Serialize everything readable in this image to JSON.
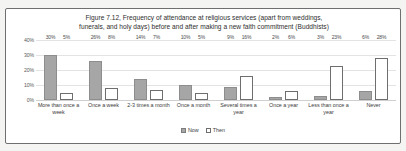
{
  "chart_data": {
    "type": "bar",
    "title": "Figure 7.12, Frequency of attendance at religious services (apart from weddings, funerals, and holy days) before and after making a new faith commitment (Buddhists)",
    "title_line1": "Figure 7.12, Frequency of attendance at religious services (apart from weddings,",
    "title_line2": "funerals, and holy days) before and after making a new faith commitment (Buddhists)",
    "xlabel": "",
    "ylabel": "",
    "ylim": [
      0,
      40
    ],
    "ytick_labels": [
      "40%",
      "30%",
      "20%",
      "10%",
      "0%"
    ],
    "ytick_values": [
      40,
      30,
      20,
      10,
      0
    ],
    "grid": true,
    "legend_position": "bottom",
    "categories": [
      "More than once a week",
      "Once a week",
      "2-3 times a month",
      "Once a month",
      "Several times a year",
      "Once a year",
      "Less than once a year",
      "Never"
    ],
    "series": [
      {
        "name": "Now",
        "color": "#a6a6a6",
        "values": [
          30,
          26,
          14,
          10,
          9,
          2,
          3,
          6
        ],
        "labels": [
          "30%",
          "26%",
          "14%",
          "10%",
          "9%",
          "2%",
          "3%",
          "6%"
        ]
      },
      {
        "name": "Then",
        "color": "#ffffff",
        "values": [
          5,
          8,
          7,
          5,
          16,
          6,
          23,
          28
        ],
        "labels": [
          "5%",
          "8%",
          "7%",
          "5%",
          "16%",
          "6%",
          "23%",
          "28%"
        ]
      }
    ]
  }
}
